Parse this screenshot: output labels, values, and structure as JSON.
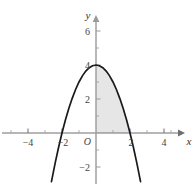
{
  "chart_data": {
    "type": "line",
    "title": "",
    "subtitle": "",
    "xlabel": "x",
    "ylabel": "y",
    "function": "y = 4 - x^2",
    "xlim": [
      -5.5,
      5.8
    ],
    "ylim": [
      -3.0,
      7.2
    ],
    "grid": false,
    "legend": null,
    "x_ticks": [
      -4,
      -2,
      2,
      4
    ],
    "x_tick_labels": [
      "−4",
      "−2",
      "2",
      "4"
    ],
    "x_minor_ticks": [
      -5,
      -3,
      -1,
      1,
      3,
      5
    ],
    "y_ticks": [
      2,
      4,
      6,
      -2
    ],
    "y_tick_labels": [
      "2",
      "4",
      "6",
      "−2"
    ],
    "y_minor_ticks": [
      1,
      3,
      5,
      -1
    ],
    "origin_label": "O",
    "curve": {
      "name": "parabola",
      "color": "#1a1a1a",
      "x": [
        -2.62,
        -2.4,
        -2.2,
        -2.0,
        -1.8,
        -1.6,
        -1.4,
        -1.2,
        -1.0,
        -0.8,
        -0.6,
        -0.4,
        -0.2,
        0.0,
        0.2,
        0.4,
        0.6,
        0.8,
        1.0,
        1.2,
        1.4,
        1.6,
        1.8,
        2.0,
        2.2,
        2.4,
        2.62
      ],
      "y": [
        -2.86,
        -1.76,
        -0.84,
        0.0,
        0.76,
        1.44,
        2.04,
        2.56,
        3.0,
        3.36,
        3.64,
        3.84,
        3.96,
        4.0,
        3.96,
        3.84,
        3.64,
        3.36,
        3.0,
        2.56,
        2.04,
        1.44,
        0.76,
        0.0,
        -0.84,
        -1.76,
        -2.86
      ]
    },
    "shaded_region": {
      "label": "area under curve",
      "x_from": 0,
      "x_to": 2,
      "fill_color": "#e6e6e6"
    },
    "axis_color": "#9a9a9a",
    "x_axis_color": "#6f6f6f",
    "curve_color": "#1a1a1a"
  },
  "axes": {
    "y_label": "y",
    "x_label": "x",
    "origin": "O"
  },
  "ticks": {
    "x": [
      "−4",
      "−2",
      "2",
      "4"
    ],
    "y": [
      "6",
      "4",
      "2",
      "−2"
    ]
  }
}
